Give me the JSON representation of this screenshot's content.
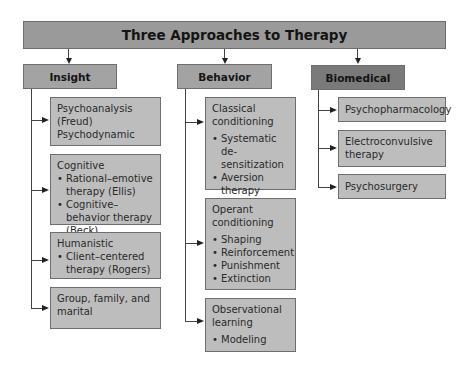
{
  "title": "Three Approaches to Therapy",
  "colors": {
    "title_bg": "#9a9a9a",
    "category_bg": "#a3a3a3",
    "biomedical_bg": "#7a7a7a",
    "leaf_bg": "#bdbdbd",
    "border": "#6e6e6e"
  },
  "categories": [
    {
      "label": "Insight",
      "items": [
        {
          "heading": "Psychoanalysis (Freud)",
          "subheading": "Psychodynamic",
          "bullets": []
        },
        {
          "heading": "Cognitive",
          "bullets": [
            "Rational–emotive therapy (Ellis)",
            "Cognitive–behavior therapy (Beck)"
          ]
        },
        {
          "heading": "Humanistic",
          "bullets": [
            "Client–centered therapy (Rogers)"
          ]
        },
        {
          "heading": "Group, family, and marital",
          "bullets": []
        }
      ]
    },
    {
      "label": "Behavior",
      "items": [
        {
          "heading": "Classical conditioning",
          "bullets": [
            "Systematic de-sensitization",
            "Aversion therapy"
          ]
        },
        {
          "heading": "Operant conditioning",
          "bullets": [
            "Shaping",
            "Reinforcement",
            "Punishment",
            "Extinction"
          ]
        },
        {
          "heading": "Observational learning",
          "bullets": [
            "Modeling"
          ]
        }
      ]
    },
    {
      "label": "Biomedical",
      "items": [
        {
          "heading": "Psychopharmacology",
          "bullets": []
        },
        {
          "heading": "Electroconvulsive therapy",
          "bullets": []
        },
        {
          "heading": "Psychosurgery",
          "bullets": []
        }
      ]
    }
  ]
}
